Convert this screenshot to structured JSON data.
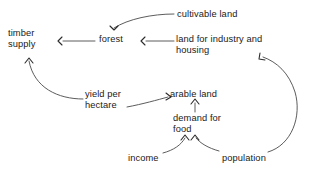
{
  "diagram": {
    "type": "causal-loop-diagram",
    "background_color": "#ffffff",
    "text_color": "#1a1a1a",
    "line_color": "#4a4a4a",
    "arrowhead_color": "#2b2b2b",
    "nodes": [
      {
        "id": "timber-supply",
        "label": "timber\nsupply",
        "x": 8,
        "y": 28
      },
      {
        "id": "forest",
        "label": "forest",
        "x": 99,
        "y": 34
      },
      {
        "id": "cultivable-land",
        "label": "cultivable land",
        "x": 177,
        "y": 9
      },
      {
        "id": "land-for-industry-and-housing",
        "label": "land for industry and\nhousing",
        "x": 176,
        "y": 34
      },
      {
        "id": "yield-per-hectare",
        "label": "yield per\nhectare",
        "x": 85,
        "y": 89
      },
      {
        "id": "arable-land",
        "label": "arable land",
        "x": 170,
        "y": 89
      },
      {
        "id": "demand-for-food",
        "label": "demand for\nfood",
        "x": 173,
        "y": 113
      },
      {
        "id": "income",
        "label": "income",
        "x": 128,
        "y": 153
      },
      {
        "id": "population",
        "label": "population",
        "x": 222,
        "y": 153
      }
    ],
    "edges": [
      {
        "id": "cultivable-land-to-forest",
        "from": "cultivable-land",
        "to": "forest",
        "path": "M 174 14 C 152 14 128 19 114 28",
        "head": "M 110 26 L 114 30 L 118 26"
      },
      {
        "id": "forest-to-timber-supply",
        "from": "forest",
        "to": "timber-supply",
        "path": "M 95 41 L 63 41",
        "head": "M 62 37 L 58 41 L 62 45"
      },
      {
        "id": "land-for-industry-to-forest",
        "from": "land-for-industry-and-housing",
        "to": "forest",
        "path": "M 174 41 L 146 41",
        "head": "M 145 37 L 141 41 L 145 45"
      },
      {
        "id": "yield-per-hectare-to-timber-supply",
        "from": "yield-per-hectare",
        "to": "timber-supply",
        "path": "M 83 99 C 58 99 34 88 29 61",
        "head": "M 25 63 L 29 58 L 33 63"
      },
      {
        "id": "yield-per-hectare-to-arable-land",
        "from": "yield-per-hectare",
        "to": "arable-land",
        "path": "M 127 107 C 143 104 157 100 168 97",
        "head": "M 166 93 L 171 97 L 166 100"
      },
      {
        "id": "demand-for-food-to-arable-land",
        "from": "demand-for-food",
        "to": "arable-land",
        "path": "M 195 112 L 195 103",
        "head": "M 191 104 L 195 99 L 199 104"
      },
      {
        "id": "income-to-demand-for-food",
        "from": "income",
        "to": "demand-for-food",
        "path": "M 163 153 C 174 150 181 145 185 138",
        "head": "M 181 140 L 185 135 L 189 140"
      },
      {
        "id": "population-to-demand-for-food",
        "from": "population",
        "to": "demand-for-food",
        "path": "M 219 151 C 208 148 200 143 196 138",
        "head": "M 191 140 L 195 135 L 199 140"
      },
      {
        "id": "population-to-land-for-industry",
        "from": "population",
        "to": "land-for-industry-and-housing",
        "path": "M 268 152 C 292 145 302 116 295 92 C 289 73 277 62 263 57",
        "head": "M 260 53 L 259 59 L 265 60"
      }
    ]
  }
}
